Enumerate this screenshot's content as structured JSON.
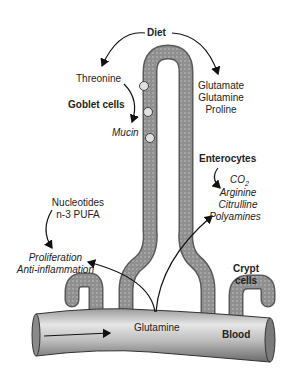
{
  "diagram": {
    "title": "Diet",
    "regions": {
      "goblet": {
        "label": "Goblet cells",
        "input": "Threonine",
        "output": "Mucin"
      },
      "villus_right": {
        "lines": [
          "Glutamate",
          "Glutamine",
          "Proline"
        ]
      },
      "enterocytes": {
        "label": "Enterocytes",
        "products": [
          "CO2",
          "Arginine",
          "Citrulline",
          "Polyamines"
        ],
        "co2_base": "CO",
        "co2_sub": "2"
      },
      "crypt": {
        "label_line1": "Crypt",
        "label_line2": "cells",
        "inputs": [
          "Nucleotides",
          "n-3 PUFA"
        ],
        "effects": [
          "Proliferation",
          "Anti-inflammation"
        ]
      },
      "blood": {
        "label": "Blood",
        "metabolite": "Glutamine"
      }
    },
    "colors": {
      "tissue": "#8c8c8c",
      "tissue_dark": "#5a5a5a",
      "vessel_light": "#e8e8e8",
      "vessel_dark": "#6e6e6e",
      "text": "#222222",
      "arrow": "#111111"
    }
  }
}
